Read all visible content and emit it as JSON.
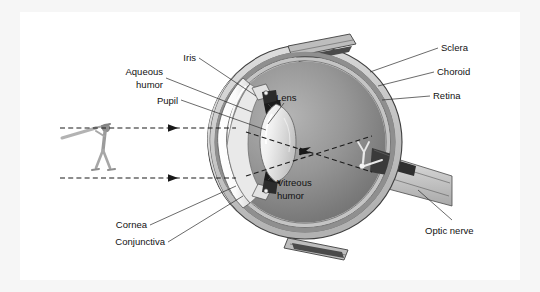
{
  "figure": {
    "type": "anatomical-diagram",
    "background_color": "#ffffff",
    "frame_color": "#f6f6f6",
    "text_color": "#111111"
  },
  "labels": {
    "iris": "Iris",
    "aqueous_humor_line1": "Aqueous",
    "aqueous_humor_line2": "humor",
    "pupil": "Pupil",
    "lens": "Lens",
    "vitreous_humor_line1": "Vitreous",
    "vitreous_humor_line2": "humor",
    "cornea": "Cornea",
    "conjunctiva": "Conjunctiva",
    "sclera": "Sclera",
    "choroid": "Choroid",
    "retina": "Retina",
    "optic_nerve": "Optic nerve"
  },
  "structures": [
    {
      "name": "sclera",
      "side": "right",
      "color": "#cfcfcf"
    },
    {
      "name": "choroid",
      "side": "right",
      "color": "#9a9a9a"
    },
    {
      "name": "retina",
      "side": "right",
      "color": "#bdbdbd"
    },
    {
      "name": "vitreous-humor",
      "side": "interior",
      "color": "#8d8d8d"
    },
    {
      "name": "lens",
      "side": "interior",
      "color": "#efefef"
    },
    {
      "name": "cornea",
      "side": "left",
      "color": "#ffffff"
    },
    {
      "name": "conjunctiva",
      "side": "left",
      "color": "#d6d6d6"
    },
    {
      "name": "iris",
      "side": "left",
      "color": "#2a2a2a"
    },
    {
      "name": "pupil",
      "side": "left",
      "color": "#1a1a1a"
    },
    {
      "name": "optic-nerve",
      "side": "right",
      "color": "#cfcfcf"
    }
  ],
  "light_path": {
    "object": "baseball batter",
    "object_position": "left, upright",
    "image": "baseball batter",
    "image_position": "retina, inverted",
    "ray_count": 2,
    "ray_style": "dashed with arrowheads"
  }
}
